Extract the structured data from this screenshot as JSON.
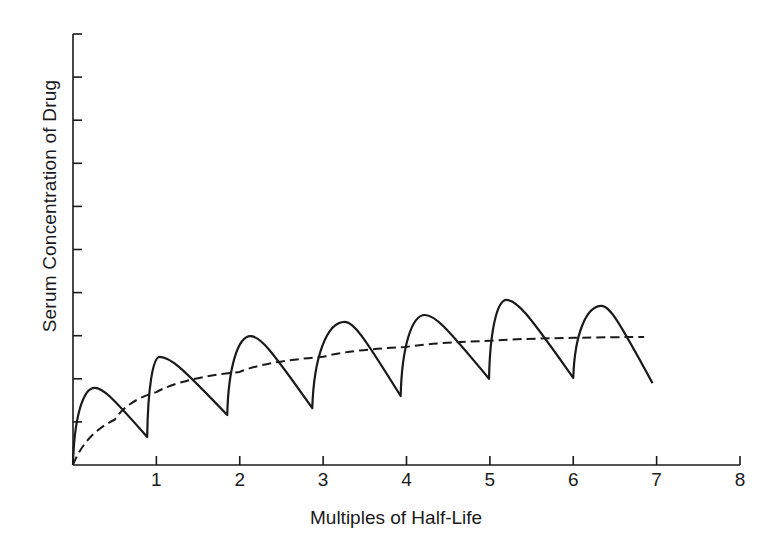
{
  "chart_data": {
    "type": "line",
    "title": "",
    "xlabel": "Multiples of Half-Life",
    "ylabel": "Serum Concentration of Drug",
    "xlim": [
      0,
      8
    ],
    "ylim": [
      0,
      10
    ],
    "x_ticks": [
      "1",
      "2",
      "3",
      "4",
      "5",
      "6",
      "7",
      "8"
    ],
    "y_ticks_count": 10,
    "y_tick_labels_shown": false,
    "grid": false,
    "legend": null,
    "series": [
      {
        "name": "Intermittent dosing concentration",
        "style": "solid",
        "points": [
          [
            0,
            0
          ],
          [
            0.26,
            1.79
          ],
          [
            0.89,
            0.65
          ],
          [
            1.04,
            2.51
          ],
          [
            1.85,
            1.16
          ],
          [
            2.13,
            2.99
          ],
          [
            2.87,
            1.32
          ],
          [
            3.26,
            3.32
          ],
          [
            3.93,
            1.6
          ],
          [
            4.22,
            3.48
          ],
          [
            4.99,
            2.0
          ],
          [
            5.2,
            3.83
          ],
          [
            6.0,
            2.02
          ],
          [
            6.34,
            3.69
          ],
          [
            6.95,
            1.9
          ]
        ]
      },
      {
        "name": "Continuous infusion / mean concentration",
        "style": "dashed",
        "points": [
          [
            0,
            0
          ],
          [
            0.5,
            1.05
          ],
          [
            1,
            1.69
          ],
          [
            2,
            2.16
          ],
          [
            3,
            2.51
          ],
          [
            4,
            2.74
          ],
          [
            5,
            2.88
          ],
          [
            6,
            2.95
          ],
          [
            6.85,
            2.97
          ]
        ]
      }
    ]
  }
}
